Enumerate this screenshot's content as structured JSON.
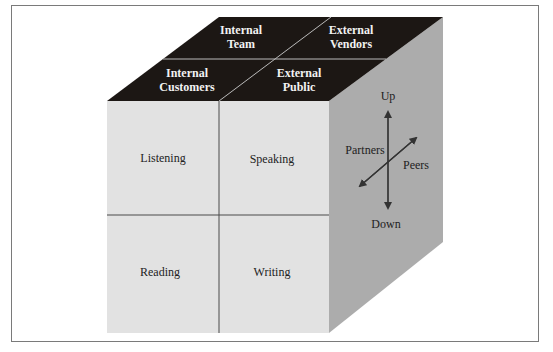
{
  "diagram": {
    "type": "communication-cube",
    "colors": {
      "top_face": "#1c1714",
      "front_face": "#e2e2e2",
      "right_face": "#acacac",
      "lines": "#4a4a4a",
      "top_divider": "#bbbbbb",
      "frame": "#7a7a7a"
    },
    "top_face": {
      "cells": [
        {
          "line1": "Internal",
          "line2": "Team"
        },
        {
          "line1": "External",
          "line2": "Vendors"
        },
        {
          "line1": "Internal",
          "line2": "Customers"
        },
        {
          "line1": "External",
          "line2": "Public"
        }
      ]
    },
    "front_face": {
      "cells": [
        "Listening",
        "Speaking",
        "Reading",
        "Writing"
      ]
    },
    "right_face": {
      "up": "Up",
      "down": "Down",
      "partners": "Partners",
      "peers": "Peers"
    }
  }
}
